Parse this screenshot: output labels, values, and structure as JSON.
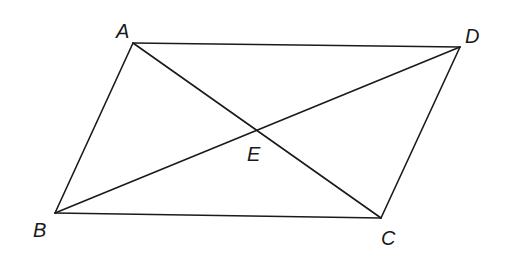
{
  "diagram": {
    "type": "parallelogram-with-diagonals",
    "line_color": "#1a1a1a",
    "background": "#ffffff",
    "points": {
      "A": {
        "label": "A",
        "x": 133,
        "y": 43
      },
      "B": {
        "label": "B",
        "x": 55,
        "y": 213
      },
      "C": {
        "label": "C",
        "x": 381,
        "y": 218
      },
      "D": {
        "label": "D",
        "x": 460,
        "y": 47
      },
      "E": {
        "label": "E",
        "x": 258,
        "y": 131
      }
    },
    "segments": [
      [
        "A",
        "D"
      ],
      [
        "D",
        "C"
      ],
      [
        "C",
        "B"
      ],
      [
        "B",
        "A"
      ],
      [
        "A",
        "C"
      ],
      [
        "B",
        "D"
      ]
    ]
  }
}
